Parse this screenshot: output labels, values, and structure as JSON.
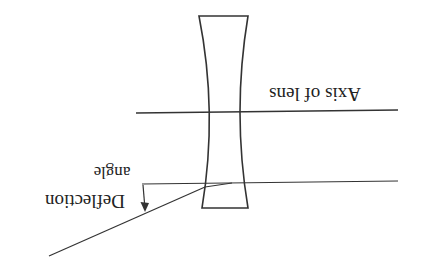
{
  "diagram": {
    "orientation": "rotated-180",
    "labels": {
      "axis": "Axis of lens",
      "deflection_line1": "Deflection",
      "deflection_line2": "angle"
    },
    "elements": [
      {
        "id": "lens",
        "kind": "concave-lens"
      },
      {
        "id": "axis",
        "kind": "optical-axis"
      },
      {
        "id": "incident-ray",
        "kind": "ray"
      },
      {
        "id": "deflected-ray",
        "kind": "ray"
      },
      {
        "id": "angle-arrow",
        "kind": "angle-indicator"
      }
    ],
    "colors": {
      "line": "#333333",
      "text": "#222222",
      "background": "#ffffff"
    }
  }
}
